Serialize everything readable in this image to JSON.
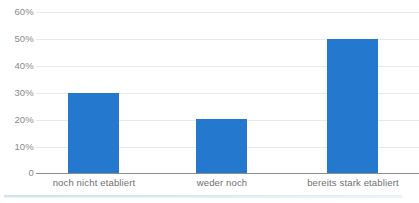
{
  "chart_data": {
    "type": "bar",
    "title": "",
    "subtitle": "",
    "xlabel": "",
    "ylabel": "",
    "categories": [
      "noch nicht etabliert",
      "weder noch",
      "bereits stark etabliert"
    ],
    "values": [
      30,
      20,
      50
    ],
    "value_labels": [
      "30%",
      "20%",
      "50%"
    ],
    "series": [
      {
        "name": "",
        "values": [
          30,
          20,
          50
        ],
        "color": "#2479cf"
      }
    ],
    "ylim": [
      0,
      60
    ],
    "ytick_values": [
      60,
      50,
      40,
      30,
      20,
      10,
      0
    ],
    "ytick_labels": [
      "60%",
      "50%",
      "40%",
      "30%",
      "20%",
      "10%",
      "0"
    ],
    "grid": true,
    "grid_axis": "y",
    "grid_color": "#e9e9ea",
    "legend": false,
    "legend_position": "none",
    "axis_line_color": "#8d8d8d",
    "bar_color": "#2479cf",
    "annotations": []
  },
  "colors": {
    "accent": "#2479cf",
    "grid": "#e9e9ea",
    "axis": "#8d8d8d",
    "tick_text": "#8a8a8c",
    "category_text": "#6f6f71",
    "footer_rule": "#d8ecf4",
    "background": "#ffffff"
  }
}
